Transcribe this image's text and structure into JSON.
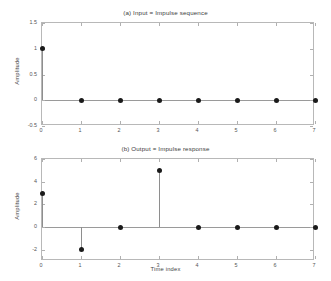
{
  "figure": {
    "background_color": "#ffffff",
    "marker_color": "#1a1a1a",
    "axis_color": "#b8b8b8",
    "stem_color": "#8e8e8e"
  },
  "chart_data": [
    {
      "type": "line",
      "plot_style": "stem",
      "id": "subplot-a",
      "title": "(a) Input = Impulse sequence",
      "xlabel": "",
      "ylabel": "Amplitude",
      "x": [
        0,
        1,
        2,
        3,
        4,
        5,
        6,
        7
      ],
      "values": [
        1,
        0,
        0,
        0,
        0,
        0,
        0,
        0
      ],
      "xlim": [
        0,
        7
      ],
      "ylim": [
        -0.5,
        1.5
      ],
      "xticks": [
        0,
        1,
        2,
        3,
        4,
        5,
        6,
        7
      ],
      "xticklabels": [
        "0",
        "1",
        "2",
        "3",
        "4",
        "5",
        "6",
        "7"
      ],
      "yticks": [
        -0.5,
        0,
        0.5,
        1,
        1.5
      ],
      "yticklabels": [
        "-0.5",
        "0",
        "0.5",
        "1",
        "1.5"
      ],
      "grid": false,
      "legend": "none"
    },
    {
      "type": "line",
      "plot_style": "stem",
      "id": "subplot-b",
      "title": "(b) Output = Impulse response",
      "xlabel": "Time index",
      "ylabel": "Amplitude",
      "x": [
        0,
        1,
        2,
        3,
        4,
        5,
        6,
        7
      ],
      "values": [
        3,
        -2,
        0,
        5,
        0,
        0,
        0,
        0
      ],
      "xlim": [
        0,
        7
      ],
      "ylim": [
        -3,
        6
      ],
      "xticks": [
        0,
        1,
        2,
        3,
        4,
        5,
        6,
        7
      ],
      "xticklabels": [
        "0",
        "1",
        "2",
        "3",
        "4",
        "5",
        "6",
        "7"
      ],
      "yticks": [
        -2,
        0,
        2,
        4,
        6
      ],
      "yticklabels": [
        "-2",
        "0",
        "2",
        "4",
        "6"
      ],
      "grid": false,
      "legend": "none"
    }
  ]
}
